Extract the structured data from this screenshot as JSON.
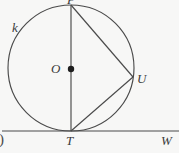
{
  "figure": {
    "background_color": "#f7f7f6",
    "stroke_color": "#4a4a4a",
    "label_color": "#3b3b3b",
    "width": 179,
    "height": 153
  },
  "labels": {
    "circle_name": "k",
    "center": "O",
    "point_top": "P",
    "point_right": "U",
    "point_tangency": "T",
    "point_line_end": "W",
    "crop_fragment": ")"
  },
  "geometry": {
    "circle": {
      "cx": 71,
      "cy": 68,
      "r": 63
    },
    "center_dot": {
      "cx": 71,
      "cy": 69,
      "r": 3.2
    },
    "point_top": {
      "x": 71,
      "y": 5
    },
    "point_right": {
      "x": 133,
      "y": 77
    },
    "point_tangency": {
      "x": 71,
      "y": 131
    },
    "tangent_line": {
      "x1": 4,
      "y1": 131,
      "x2": 179,
      "y2": 131
    },
    "chords": [
      {
        "name": "diameter-top-to-T",
        "x1": 71,
        "y1": 5,
        "x2": 71,
        "y2": 131
      },
      {
        "name": "chord-top-to-U",
        "x1": 71,
        "y1": 5,
        "x2": 133,
        "y2": 77
      },
      {
        "name": "chord-U-to-T",
        "x1": 133,
        "y1": 77,
        "x2": 71,
        "y2": 131
      }
    ]
  }
}
